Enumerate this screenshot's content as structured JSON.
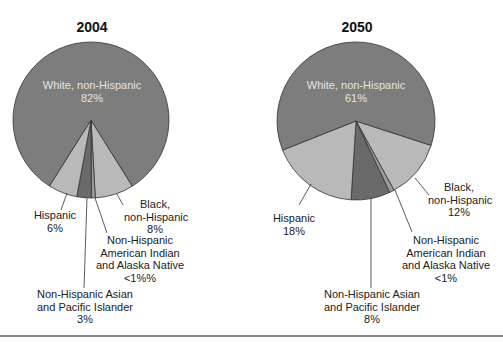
{
  "chart_data": [
    {
      "type": "pie",
      "title": "2004",
      "categories": [
        "White, non-Hispanic",
        "Black, non-Hispanic",
        "Non-Hispanic American Indian and Alaska Native",
        "Non-Hispanic Asian and Pacific Islander",
        "Hispanic"
      ],
      "values": [
        82,
        8,
        0.8,
        3,
        6
      ],
      "value_labels": [
        "82%",
        "8%",
        "<1%%",
        "3%",
        "6%"
      ],
      "colors": [
        "#7d7d7d",
        "#b9b9b9",
        "#9a9a9a",
        "#6a6a6a",
        "#b9b9b9"
      ],
      "legend": "none (callout labels)"
    },
    {
      "type": "pie",
      "title": "2050",
      "categories": [
        "White, non-Hispanic",
        "Black, non-Hispanic",
        "Non-Hispanic American Indian and Alaska Native",
        "Non-Hispanic Asian and Pacific Islander",
        "Hispanic"
      ],
      "values": [
        61,
        12,
        1,
        8,
        18
      ],
      "value_labels": [
        "61%",
        "12%",
        "<1%",
        "8%",
        "18%"
      ],
      "colors": [
        "#7d7d7d",
        "#b9b9b9",
        "#9a9a9a",
        "#6a6a6a",
        "#b9b9b9"
      ],
      "legend": "none (callout labels)"
    }
  ],
  "left": {
    "title": "2004",
    "white": {
      "line1": "White, non-Hispanic",
      "line2": "82%"
    },
    "black": {
      "line1": "Black,",
      "line2": "non-Hispanic",
      "line3": "8%"
    },
    "aian": {
      "line1": "Non-Hispanic",
      "line2": "American Indian",
      "line3": "and Alaska Native",
      "line4": "<1%%"
    },
    "asian": {
      "line1": "Non-Hispanic Asian",
      "line2": "and Pacific Islander",
      "line3": "3%"
    },
    "hispanic": {
      "line1": "Hispanic",
      "line2": "6%"
    }
  },
  "right": {
    "title": "2050",
    "white": {
      "line1": "White, non-Hispanic",
      "line2": "61%"
    },
    "black": {
      "line1": "Black,",
      "line2": "non-Hispanic",
      "line3": "12%"
    },
    "aian": {
      "line1": "Non-Hispanic",
      "line2": "American Indian",
      "line3": "and Alaska Native",
      "line4": "<1%"
    },
    "asian": {
      "line1": "Non-Hispanic Asian",
      "line2": "and Pacific Islander",
      "line3": "8%"
    },
    "hispanic": {
      "line1": "Hispanic",
      "line2": "18%"
    }
  }
}
